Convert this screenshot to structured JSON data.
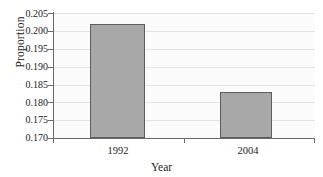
{
  "chart_data": {
    "type": "bar",
    "title": "",
    "xlabel": "Year",
    "ylabel": "Proportion",
    "categories": [
      "1992",
      "2004"
    ],
    "values": [
      0.202,
      0.183
    ],
    "series": [
      {
        "name": "Proportion",
        "values": [
          0.202,
          0.183
        ]
      }
    ],
    "ylim": [
      0.17,
      0.205
    ],
    "ytick_labels": [
      "0.205",
      "0.200",
      "0.195",
      "0.190",
      "0.185",
      "0.180",
      "0.175",
      "0.170"
    ],
    "ytick_values": [
      0.205,
      0.2,
      0.195,
      0.19,
      0.185,
      0.18,
      0.175,
      0.17
    ],
    "ytick_step": 0.005,
    "grid": true,
    "legend": false,
    "legend_position": "none",
    "bar_color": "#a8a8a8",
    "bar_edge_color": "#5d5d5d",
    "plot_background": "#fbfbfb",
    "gridline_color": "#e3e3e3",
    "axis_color": "#6a6a6a"
  }
}
